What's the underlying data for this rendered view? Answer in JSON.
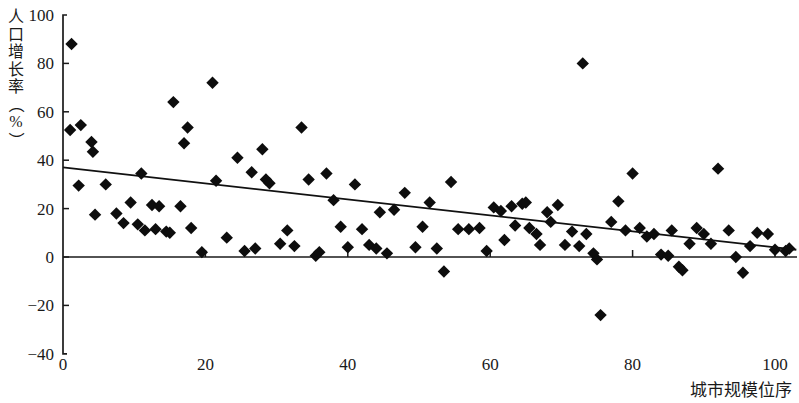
{
  "chart_data": {
    "type": "scatter",
    "title": "",
    "xlabel": "城市规模位序",
    "ylabel": "人口增长率（%）",
    "ylabel_chars": [
      "人",
      "口",
      "增",
      "长",
      "率",
      "（",
      "%",
      "）"
    ],
    "xlim": [
      0,
      103
    ],
    "ylim": [
      -40,
      100
    ],
    "xticks": [
      0,
      20,
      40,
      60,
      80,
      100
    ],
    "xtick_labels": [
      "0",
      "20",
      "40",
      "60",
      "80",
      "100"
    ],
    "yticks": [
      -40,
      -20,
      0,
      20,
      40,
      60,
      80,
      100
    ],
    "ytick_labels": [
      "-40",
      "-20",
      "0",
      "20",
      "40",
      "60",
      "80",
      "100"
    ],
    "grid": false,
    "legend": null,
    "marker": "diamond",
    "marker_color": "#0d0d0d",
    "zero_line": 0,
    "trendline": {
      "name": "linear fit",
      "x": [
        0,
        103
      ],
      "y": [
        37,
        3
      ],
      "color": "#111111"
    },
    "series": [
      {
        "name": "城市",
        "points": [
          [
            1.2,
            88
          ],
          [
            1.0,
            52.5
          ],
          [
            2.5,
            54.5
          ],
          [
            2.2,
            29.5
          ],
          [
            4.0,
            47.5
          ],
          [
            4.2,
            43.5
          ],
          [
            4.5,
            17.5
          ],
          [
            6.0,
            30.0
          ],
          [
            7.5,
            18.0
          ],
          [
            8.5,
            14.0
          ],
          [
            9.5,
            22.5
          ],
          [
            10.5,
            13.5
          ],
          [
            11.0,
            34.5
          ],
          [
            11.5,
            11.0
          ],
          [
            12.5,
            21.5
          ],
          [
            13.0,
            11.5
          ],
          [
            13.5,
            21.0
          ],
          [
            14.5,
            10.5
          ],
          [
            15.0,
            10.0
          ],
          [
            15.5,
            64.0
          ],
          [
            16.5,
            21.0
          ],
          [
            17.0,
            47.0
          ],
          [
            17.5,
            53.5
          ],
          [
            18.0,
            12.0
          ],
          [
            19.5,
            2.0
          ],
          [
            21.0,
            72.0
          ],
          [
            21.5,
            31.5
          ],
          [
            23.0,
            8.0
          ],
          [
            24.5,
            41.0
          ],
          [
            25.5,
            2.5
          ],
          [
            26.5,
            35.0
          ],
          [
            27.0,
            3.5
          ],
          [
            28.0,
            44.5
          ],
          [
            28.5,
            32.0
          ],
          [
            29.0,
            30.5
          ],
          [
            30.5,
            5.5
          ],
          [
            31.5,
            11.0
          ],
          [
            32.5,
            4.5
          ],
          [
            33.5,
            53.5
          ],
          [
            34.5,
            32.0
          ],
          [
            35.5,
            0.5
          ],
          [
            36.0,
            2.0
          ],
          [
            37.0,
            34.5
          ],
          [
            38.0,
            23.5
          ],
          [
            39.0,
            12.5
          ],
          [
            40.0,
            4.0
          ],
          [
            41.0,
            30.0
          ],
          [
            42.0,
            11.5
          ],
          [
            43.0,
            5.0
          ],
          [
            44.0,
            3.5
          ],
          [
            44.5,
            18.5
          ],
          [
            45.5,
            1.5
          ],
          [
            46.5,
            19.5
          ],
          [
            48.0,
            26.5
          ],
          [
            49.5,
            4.0
          ],
          [
            50.5,
            12.5
          ],
          [
            51.5,
            22.5
          ],
          [
            52.5,
            3.5
          ],
          [
            53.5,
            -6.0
          ],
          [
            54.5,
            31.0
          ],
          [
            55.5,
            11.5
          ],
          [
            57.0,
            11.5
          ],
          [
            58.5,
            12.0
          ],
          [
            59.5,
            2.5
          ],
          [
            60.5,
            20.5
          ],
          [
            61.5,
            19.0
          ],
          [
            62.0,
            7.0
          ],
          [
            63.0,
            21.0
          ],
          [
            63.5,
            13.0
          ],
          [
            64.5,
            22.0
          ],
          [
            65.0,
            22.5
          ],
          [
            65.5,
            12.0
          ],
          [
            66.5,
            9.5
          ],
          [
            67.0,
            5.0
          ],
          [
            68.0,
            18.5
          ],
          [
            68.5,
            14.5
          ],
          [
            69.5,
            21.5
          ],
          [
            70.5,
            5.0
          ],
          [
            71.5,
            10.5
          ],
          [
            72.5,
            4.5
          ],
          [
            73.0,
            80.0
          ],
          [
            73.5,
            9.5
          ],
          [
            74.5,
            1.5
          ],
          [
            75.0,
            -1.0
          ],
          [
            75.5,
            -24.0
          ],
          [
            77.0,
            14.5
          ],
          [
            78.0,
            23.0
          ],
          [
            79.0,
            11.0
          ],
          [
            80.0,
            34.5
          ],
          [
            81.0,
            12.0
          ],
          [
            82.0,
            8.5
          ],
          [
            83.0,
            9.5
          ],
          [
            84.0,
            1.0
          ],
          [
            85.0,
            0.5
          ],
          [
            85.5,
            11.0
          ],
          [
            86.5,
            -4.0
          ],
          [
            87.0,
            -5.5
          ],
          [
            88.0,
            5.5
          ],
          [
            89.0,
            12.0
          ],
          [
            90.0,
            9.5
          ],
          [
            91.0,
            5.5
          ],
          [
            92.0,
            36.5
          ],
          [
            93.5,
            11.0
          ],
          [
            94.5,
            0.0
          ],
          [
            95.5,
            -6.5
          ],
          [
            96.5,
            4.5
          ],
          [
            97.5,
            10.0
          ],
          [
            99.0,
            9.5
          ],
          [
            100.0,
            3.0
          ],
          [
            101.5,
            2.5
          ],
          [
            102.0,
            3.5
          ]
        ]
      }
    ]
  }
}
